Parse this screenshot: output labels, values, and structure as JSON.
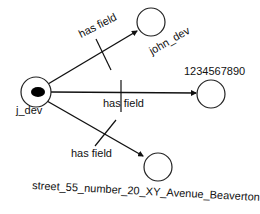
{
  "diagram": {
    "type": "graph",
    "colors": {
      "stroke": "#111111",
      "background": "#ffffff",
      "source_fill": "#000000"
    },
    "source_node": {
      "id": "j_dev",
      "label": "j_dev"
    },
    "nodes": [
      {
        "id": "john_dev",
        "label": "john_dev"
      },
      {
        "id": "phone",
        "label": "1234567890"
      },
      {
        "id": "address",
        "label": "street_55_number_20_XY_Avenue_Beaverton"
      }
    ],
    "edges": [
      {
        "from": "j_dev",
        "to": "john_dev",
        "label": "has field"
      },
      {
        "from": "j_dev",
        "to": "1234567890",
        "label": "has field"
      },
      {
        "from": "j_dev",
        "to": "street_55_number_20_XY_Avenue_Beaverton",
        "label": "has field"
      }
    ]
  }
}
